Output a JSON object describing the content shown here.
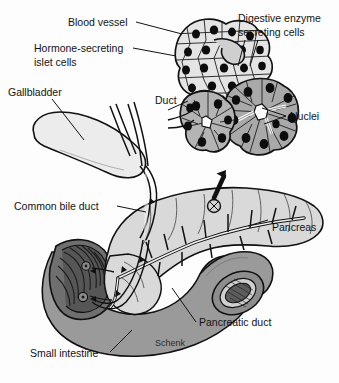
{
  "figure": {
    "title_partial": "Other pancreatic cells secrete digestive enzymes",
    "signature": "Schenk",
    "colors": {
      "background": "#fdfdfd",
      "outline": "#111111",
      "pancreas_fill": "#d9d9d9",
      "gallbladder_fill": "#ececec",
      "intestine_fill": "#9a9a9a",
      "intestine_dark": "#6f6f6f",
      "islet_fill": "#e4e4e4",
      "acinar_fill": "#a9a9a9",
      "nucleus_fill": "#0d0d0d",
      "duct_fill": "#f2f2f2",
      "folds_fill": "#4a4a4a"
    }
  },
  "labels": {
    "blood_vessel": "Blood vessel",
    "hormone_islet_line1": "Hormone-secreting",
    "hormone_islet_line2": "islet cells",
    "digestive_line1": "Digestive enzyme",
    "digestive_line2": "secreting cells",
    "nuclei": "Nuclei",
    "gallbladder": "Gallbladder",
    "duct": "Duct",
    "common_bile_duct": "Common bile duct",
    "pancreas": "Pancreas",
    "pancreatic_duct": "Pancreatic duct",
    "small_intestine": "Small intestine"
  }
}
